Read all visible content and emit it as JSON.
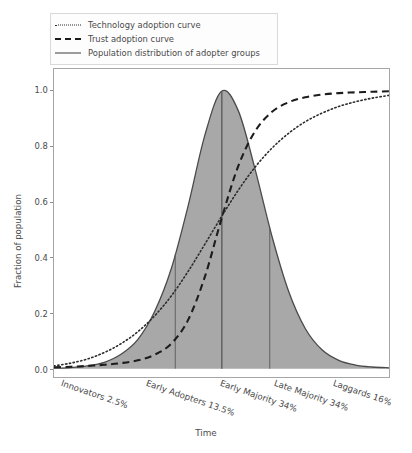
{
  "chart_data": {
    "type": "area",
    "title": "",
    "xlabel": "Time",
    "ylabel": "Fraction of population",
    "ylim": [
      -0.03,
      1.08
    ],
    "xlim": [
      0,
      1
    ],
    "grid": false,
    "legend_position": "upper left",
    "y_ticks": [
      "0.0",
      "0.2",
      "0.4",
      "0.6",
      "0.8",
      "1.0"
    ],
    "y_tick_values": [
      0.0,
      0.2,
      0.4,
      0.6,
      0.8,
      1.0
    ],
    "categories": [
      "Innovators 2.5%",
      "Early Adopters 13.5%",
      "Early Majority 34%",
      "Late Majority 34%",
      "Laggards 16%"
    ],
    "category_shares": [
      2.5,
      13.5,
      34,
      34,
      16
    ],
    "segment_boundaries": [
      0.362,
      0.501,
      0.644
    ],
    "series": [
      {
        "name": "Population distribution of adopter groups",
        "style": "solid",
        "fill": "#a8a8a8",
        "color": "#4a4a4a",
        "peak_x": 0.501,
        "peak_y": 1.0,
        "x": [
          0.0,
          0.05,
          0.1,
          0.15,
          0.2,
          0.25,
          0.3,
          0.35,
          0.4,
          0.45,
          0.5,
          0.55,
          0.6,
          0.65,
          0.7,
          0.75,
          0.8,
          0.85,
          0.9,
          0.95,
          1.0
        ],
        "y": [
          0.002,
          0.004,
          0.01,
          0.023,
          0.052,
          0.105,
          0.205,
          0.36,
          0.585,
          0.84,
          1.0,
          0.93,
          0.72,
          0.48,
          0.28,
          0.145,
          0.068,
          0.03,
          0.013,
          0.006,
          0.003
        ]
      },
      {
        "name": "Trust adoption curve",
        "style": "dashed",
        "color": "#1c1c1c",
        "x": [
          0.0,
          0.05,
          0.1,
          0.15,
          0.2,
          0.25,
          0.3,
          0.35,
          0.4,
          0.45,
          0.5,
          0.55,
          0.6,
          0.65,
          0.7,
          0.75,
          0.8,
          0.85,
          0.9,
          0.95,
          1.0
        ],
        "y": [
          0.005,
          0.007,
          0.01,
          0.014,
          0.02,
          0.03,
          0.05,
          0.09,
          0.175,
          0.33,
          0.54,
          0.73,
          0.855,
          0.925,
          0.96,
          0.978,
          0.988,
          0.993,
          0.996,
          0.998,
          1.0
        ]
      },
      {
        "name": "Technology adoption curve",
        "style": "dotted",
        "color": "#2b2b2b",
        "x": [
          0.0,
          0.05,
          0.1,
          0.15,
          0.2,
          0.25,
          0.3,
          0.35,
          0.4,
          0.45,
          0.5,
          0.55,
          0.6,
          0.65,
          0.7,
          0.75,
          0.8,
          0.85,
          0.9,
          0.95,
          1.0
        ],
        "y": [
          0.01,
          0.02,
          0.035,
          0.058,
          0.09,
          0.133,
          0.19,
          0.262,
          0.35,
          0.448,
          0.548,
          0.643,
          0.726,
          0.794,
          0.848,
          0.89,
          0.921,
          0.945,
          0.962,
          0.975,
          0.985
        ]
      }
    ]
  },
  "legend": {
    "items": [
      {
        "label": "Technology adoption curve",
        "style": "dotted"
      },
      {
        "label": "Trust adoption curve",
        "style": "dashed"
      },
      {
        "label": "Population distribution of adopter groups",
        "style": "solid"
      }
    ]
  },
  "axes": {
    "y_title": "Fraction of population",
    "x_title": "Time"
  }
}
